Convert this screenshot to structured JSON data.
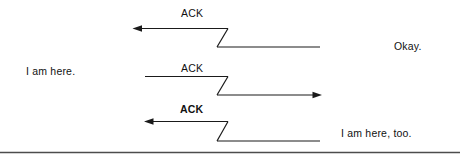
{
  "figure": {
    "title": "",
    "background_color": "#ffffff",
    "line_color": "#1a1a1a",
    "text_color": "#111111",
    "rule_color": "#4d4d4d",
    "messages": [
      {
        "id": "row-1",
        "ack_label": "ACK",
        "ack_bold": false,
        "direction": "left",
        "arrowhead": "left-end",
        "annotation": "Okay.",
        "annotation_side": "right"
      },
      {
        "id": "row-2",
        "ack_label": "ACK",
        "ack_bold": false,
        "direction": "right",
        "arrowhead": "right-end",
        "annotation": "I am here.",
        "annotation_side": "left"
      },
      {
        "id": "row-3",
        "ack_label": "ACK",
        "ack_bold": true,
        "direction": "left",
        "arrowhead": "left-end",
        "annotation": "I am here, too.",
        "annotation_side": "right"
      }
    ],
    "labels": {
      "ack_1": "ACK",
      "ack_2": "ACK",
      "ack_3": "ACK",
      "okay": "Okay.",
      "i_am_here": "I am here.",
      "i_am_here_too": "I am here, too."
    },
    "footer_rule": true
  }
}
